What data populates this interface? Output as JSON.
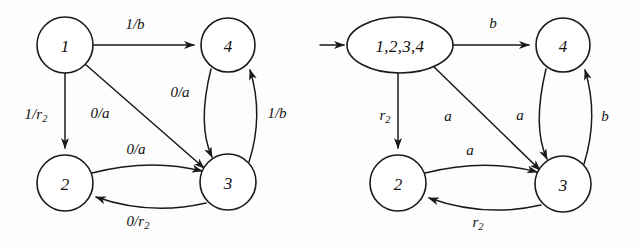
{
  "figure": {
    "background_color": "#fdfdfd",
    "ink_color": "#1a1a1a",
    "diagrams": [
      {
        "id": "left-automaton",
        "name": "mealy-machine-input-output",
        "nodes": [
          {
            "id": "n1",
            "label": "1",
            "shape": "circle",
            "cx": 65,
            "cy": 45,
            "r": 28
          },
          {
            "id": "n4",
            "label": "4",
            "shape": "circle",
            "cx": 228,
            "cy": 45,
            "r": 27
          },
          {
            "id": "n2",
            "label": "2",
            "shape": "circle",
            "cx": 65,
            "cy": 183,
            "r": 28
          },
          {
            "id": "n3",
            "label": "3",
            "shape": "circle",
            "cx": 228,
            "cy": 182,
            "r": 28
          }
        ],
        "edges": [
          {
            "id": "e1",
            "from": "n1",
            "to": "n4",
            "label": "1/b",
            "sub": "",
            "lx": 135,
            "ly": 24
          },
          {
            "id": "e2",
            "from": "n1",
            "to": "n2",
            "label": "1/r",
            "sub": "2",
            "lx": 36,
            "ly": 114
          },
          {
            "id": "e3",
            "from": "n1",
            "to": "n3",
            "label": "0/a",
            "sub": "",
            "lx": 100,
            "ly": 113
          },
          {
            "id": "e4",
            "from": "n4",
            "to": "n3",
            "label": "0/a",
            "sub": "",
            "lx": 180,
            "ly": 92
          },
          {
            "id": "e5",
            "from": "n3",
            "to": "n4",
            "label": "1/b",
            "sub": "",
            "lx": 277,
            "ly": 113
          },
          {
            "id": "e6",
            "from": "n2",
            "to": "n3",
            "label": "0/a",
            "sub": "",
            "lx": 136,
            "ly": 149
          },
          {
            "id": "e7",
            "from": "n3",
            "to": "n2",
            "label": "0/r",
            "sub": "2",
            "lx": 138,
            "ly": 221
          }
        ]
      },
      {
        "id": "right-automaton",
        "name": "subset-construction-automaton",
        "start_arrow": {
          "x1": 320,
          "y1": 45,
          "x2": 347,
          "y2": 45
        },
        "nodes": [
          {
            "id": "m1",
            "label": "1,2,3,4",
            "shape": "ellipse",
            "cx": 400,
            "cy": 45,
            "rx": 53,
            "ry": 28
          },
          {
            "id": "m4",
            "label": "4",
            "shape": "circle",
            "cx": 563,
            "cy": 45,
            "r": 27
          },
          {
            "id": "m2",
            "label": "2",
            "shape": "circle",
            "cx": 398,
            "cy": 183,
            "r": 28
          },
          {
            "id": "m3",
            "label": "3",
            "shape": "circle",
            "cx": 563,
            "cy": 184,
            "r": 28
          }
        ],
        "edges": [
          {
            "id": "f1",
            "from": "m1",
            "to": "m4",
            "label": "b",
            "sub": "",
            "lx": 493,
            "ly": 23
          },
          {
            "id": "f2",
            "from": "m1",
            "to": "m2",
            "label": "r",
            "sub": "2",
            "lx": 385,
            "ly": 115
          },
          {
            "id": "f3",
            "from": "m1",
            "to": "m3",
            "label": "a",
            "sub": "",
            "lx": 448,
            "ly": 116
          },
          {
            "id": "f4",
            "from": "m4",
            "to": "m3",
            "label": "a",
            "sub": "",
            "lx": 520,
            "ly": 115
          },
          {
            "id": "f5",
            "from": "m3",
            "to": "m4",
            "label": "b",
            "sub": "",
            "lx": 605,
            "ly": 116
          },
          {
            "id": "f6",
            "from": "m2",
            "to": "m3",
            "label": "a",
            "sub": "",
            "lx": 470,
            "ly": 150
          },
          {
            "id": "f7",
            "from": "m3",
            "to": "m2",
            "label": "r",
            "sub": "2",
            "lx": 478,
            "ly": 222
          }
        ]
      }
    ]
  }
}
